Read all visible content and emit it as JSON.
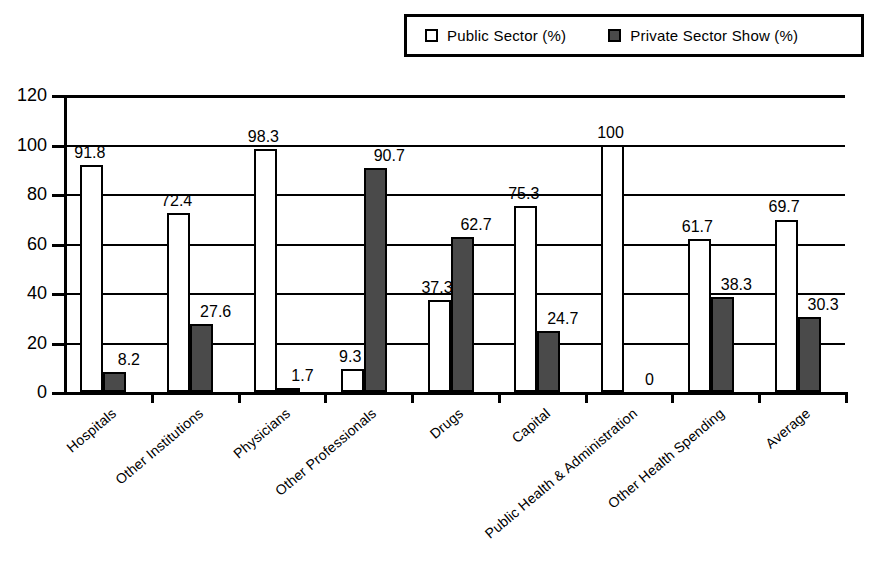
{
  "legend": {
    "entries": [
      {
        "label": "Public Sector (%)",
        "swatch": "white-square-icon",
        "color": "#ffffff"
      },
      {
        "label": "Private Sector Show (%)",
        "swatch": "dark-square-icon",
        "color": "#4a4a4a"
      }
    ]
  },
  "axes": {
    "y_ticks": [
      "0",
      "20",
      "40",
      "60",
      "80",
      "100",
      "120"
    ]
  },
  "chart_data": {
    "type": "bar",
    "title": "",
    "subtitle": "",
    "xlabel": "",
    "ylabel": "",
    "ylim": [
      0,
      120
    ],
    "ytick_step": 20,
    "grid": true,
    "legend_position": "top-right",
    "categories": [
      "Hospitals",
      "Other Institutions",
      "Physicians",
      "Other Professionals",
      "Drugs",
      "Capital",
      "Public Health & Administration",
      "Other Health Spending",
      "Average"
    ],
    "series": [
      {
        "name": "Public Sector (%)",
        "color": "#ffffff",
        "values": [
          91.8,
          72.4,
          98.3,
          9.3,
          37.3,
          75.3,
          100,
          61.7,
          69.7
        ],
        "labels": [
          "91.8",
          "72.4",
          "98.3",
          "9.3",
          "37.3",
          "75.3",
          "100",
          "61.7",
          "69.7"
        ]
      },
      {
        "name": "Private Sector Show (%)",
        "color": "#4a4a4a",
        "values": [
          8.2,
          27.6,
          1.7,
          90.7,
          62.7,
          24.7,
          0,
          38.3,
          30.3
        ],
        "labels": [
          "8.2",
          "27.6",
          "1.7",
          "90.7",
          "62.7",
          "24.7",
          "0",
          "38.3",
          "30.3"
        ]
      }
    ]
  }
}
